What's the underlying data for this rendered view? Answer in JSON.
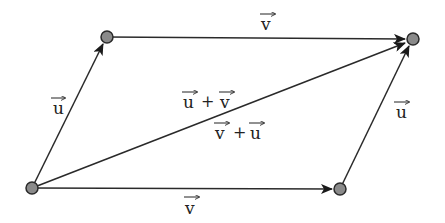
{
  "diagram": {
    "colors": {
      "line": "#2a2a2a",
      "node_fill": "#8a8a8a",
      "node_stroke": "#2a2a2a",
      "text": "#222222"
    },
    "nodes": [
      {
        "id": "A",
        "x": 32,
        "y": 188
      },
      {
        "id": "B",
        "x": 107,
        "y": 37
      },
      {
        "id": "C",
        "x": 413,
        "y": 39
      },
      {
        "id": "D",
        "x": 340,
        "y": 189
      }
    ],
    "edges": [
      {
        "from": "A",
        "to": "B",
        "label": "u",
        "arrow": true
      },
      {
        "from": "B",
        "to": "C",
        "label": "v",
        "arrow": true
      },
      {
        "from": "A",
        "to": "D",
        "label": "v",
        "arrow": true
      },
      {
        "from": "D",
        "to": "C",
        "label": "u",
        "arrow": true
      },
      {
        "from": "A",
        "to": "C",
        "label": "diagonal",
        "arrow": true
      }
    ],
    "labels": {
      "left_u": "u",
      "top_v": "v",
      "bottom_v": "v",
      "right_u": "u",
      "diag_upper_a": "u",
      "diag_upper_plus": "+",
      "diag_upper_b": "v",
      "diag_lower_a": "v",
      "diag_lower_plus": "+",
      "diag_lower_b": "u"
    }
  }
}
